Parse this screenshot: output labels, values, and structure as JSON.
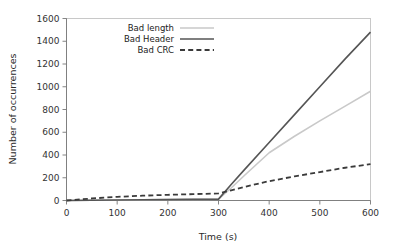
{
  "chart_data": {
    "type": "line",
    "title": "",
    "xlabel": "Time (s)",
    "ylabel": "Number of occurrences",
    "xlim": [
      0,
      600
    ],
    "ylim": [
      0,
      1600
    ],
    "xticks": [
      0,
      100,
      200,
      300,
      400,
      500,
      600
    ],
    "yticks": [
      0,
      200,
      400,
      600,
      800,
      1000,
      1200,
      1400,
      1600
    ],
    "grid": false,
    "legend_position": "upper-left-inside",
    "x": [
      0,
      50,
      100,
      150,
      200,
      250,
      300,
      325,
      350,
      400,
      450,
      500,
      550,
      600
    ],
    "series": [
      {
        "name": "Bad length",
        "style": "solid",
        "color": "#c9c9c9",
        "width": 1.6,
        "values": [
          0,
          2,
          4,
          6,
          8,
          10,
          12,
          110,
          215,
          420,
          565,
          700,
          830,
          960
        ]
      },
      {
        "name": "Bad Header",
        "style": "solid",
        "color": "#555555",
        "width": 1.6,
        "values": [
          0,
          2,
          4,
          6,
          8,
          10,
          12,
          140,
          265,
          510,
          755,
          1000,
          1245,
          1480
        ]
      },
      {
        "name": "Bad CRC",
        "style": "dashed",
        "color": "#3a3a3a",
        "width": 1.8,
        "values": [
          0,
          18,
          32,
          42,
          50,
          56,
          62,
          90,
          118,
          170,
          212,
          250,
          288,
          320
        ]
      }
    ]
  },
  "legend": {
    "entries": [
      {
        "label": "Bad length"
      },
      {
        "label": "Bad Header"
      },
      {
        "label": "Bad CRC"
      }
    ]
  },
  "axes": {
    "x_title": "Time (s)",
    "y_title": "Number of occurrences",
    "x_tick_labels": [
      "0",
      "100",
      "200",
      "300",
      "400",
      "500",
      "600"
    ],
    "y_tick_labels": [
      "0",
      "200",
      "400",
      "600",
      "800",
      "1000",
      "1200",
      "1400",
      "1600"
    ]
  }
}
